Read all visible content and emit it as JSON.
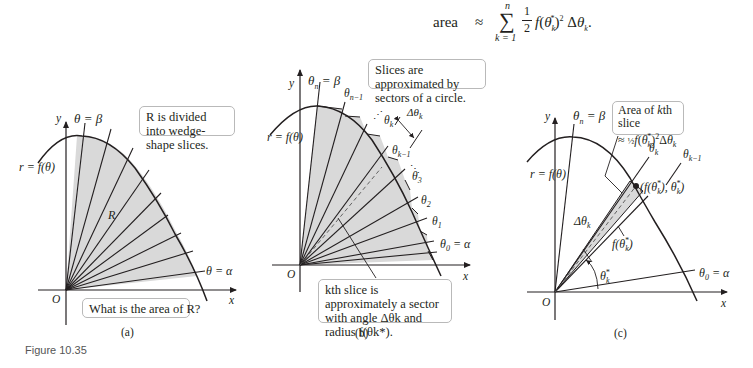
{
  "formula": {
    "lhs": "area",
    "relation": "≈",
    "sum_upper": "n",
    "sum_lower": "k = 1",
    "fraction": "1/2",
    "body": "f(θ_k*)² Δθ_k."
  },
  "figure_label": "Figure 10.35",
  "panels": [
    {
      "id": "a",
      "caption": "(a)",
      "labels": {
        "y_axis": "y",
        "x_axis": "x",
        "origin": "O",
        "curve": "r = f(θ)",
        "top_ray": "θ = β",
        "bottom_ray": "θ = α",
        "region": "R"
      },
      "callouts": [
        "R is divided into wedge-shape slices.",
        "What is the area of R?"
      ]
    },
    {
      "id": "b",
      "caption": "(b)",
      "labels": {
        "y_axis": "y",
        "x_axis": "x",
        "origin": "O",
        "curve": "r = f(θ)",
        "rays": [
          "θn = β",
          "θn−1",
          "θk",
          "θk−1",
          "θ3",
          "θ2",
          "θ1",
          "θ0 = α"
        ],
        "delta": "Δθk"
      },
      "callouts": [
        "Slices are approximated by sectors of a circle.",
        "kth slice is approximately a sector with angle Δθk and radius f(θk*)."
      ]
    },
    {
      "id": "c",
      "caption": "(c)",
      "labels": {
        "y_axis": "y",
        "x_axis": "x",
        "origin": "O",
        "curve": "r = f(θ)",
        "top_ray": "θn = β",
        "ray_k": "θk",
        "ray_k_minus_1": "θk−1",
        "point": "(f(θk*), θk*)",
        "delta": "Δθk",
        "radius": "f(θk*)",
        "angle": "θk*",
        "bottom_ray": "θ0 = α"
      },
      "callouts": [
        "Area of kth slice ≈ ½ f(θk*)² Δθk"
      ]
    }
  ],
  "colors": {
    "fill": "#d9d9d9",
    "line": "#231f20",
    "box_border": "#b9b9b9"
  }
}
